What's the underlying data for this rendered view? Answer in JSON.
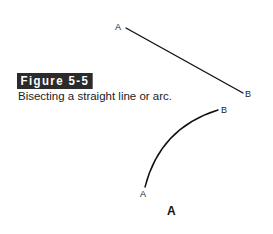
{
  "figure": {
    "label": "Figure 5-5",
    "caption": "Bisecting a straight line or arc.",
    "label_bg_color": "#2b2b2b",
    "label_text_color": "#ffffff"
  },
  "straight_line": {
    "start_label": "A",
    "end_label": "B",
    "start": [
      126,
      28
    ],
    "end": [
      243,
      93
    ]
  },
  "arc": {
    "start_label": "A",
    "end_label": "B",
    "start": [
      145,
      187
    ],
    "end": [
      218,
      110
    ]
  },
  "subfigure_label": "A",
  "line_color": "#111111"
}
